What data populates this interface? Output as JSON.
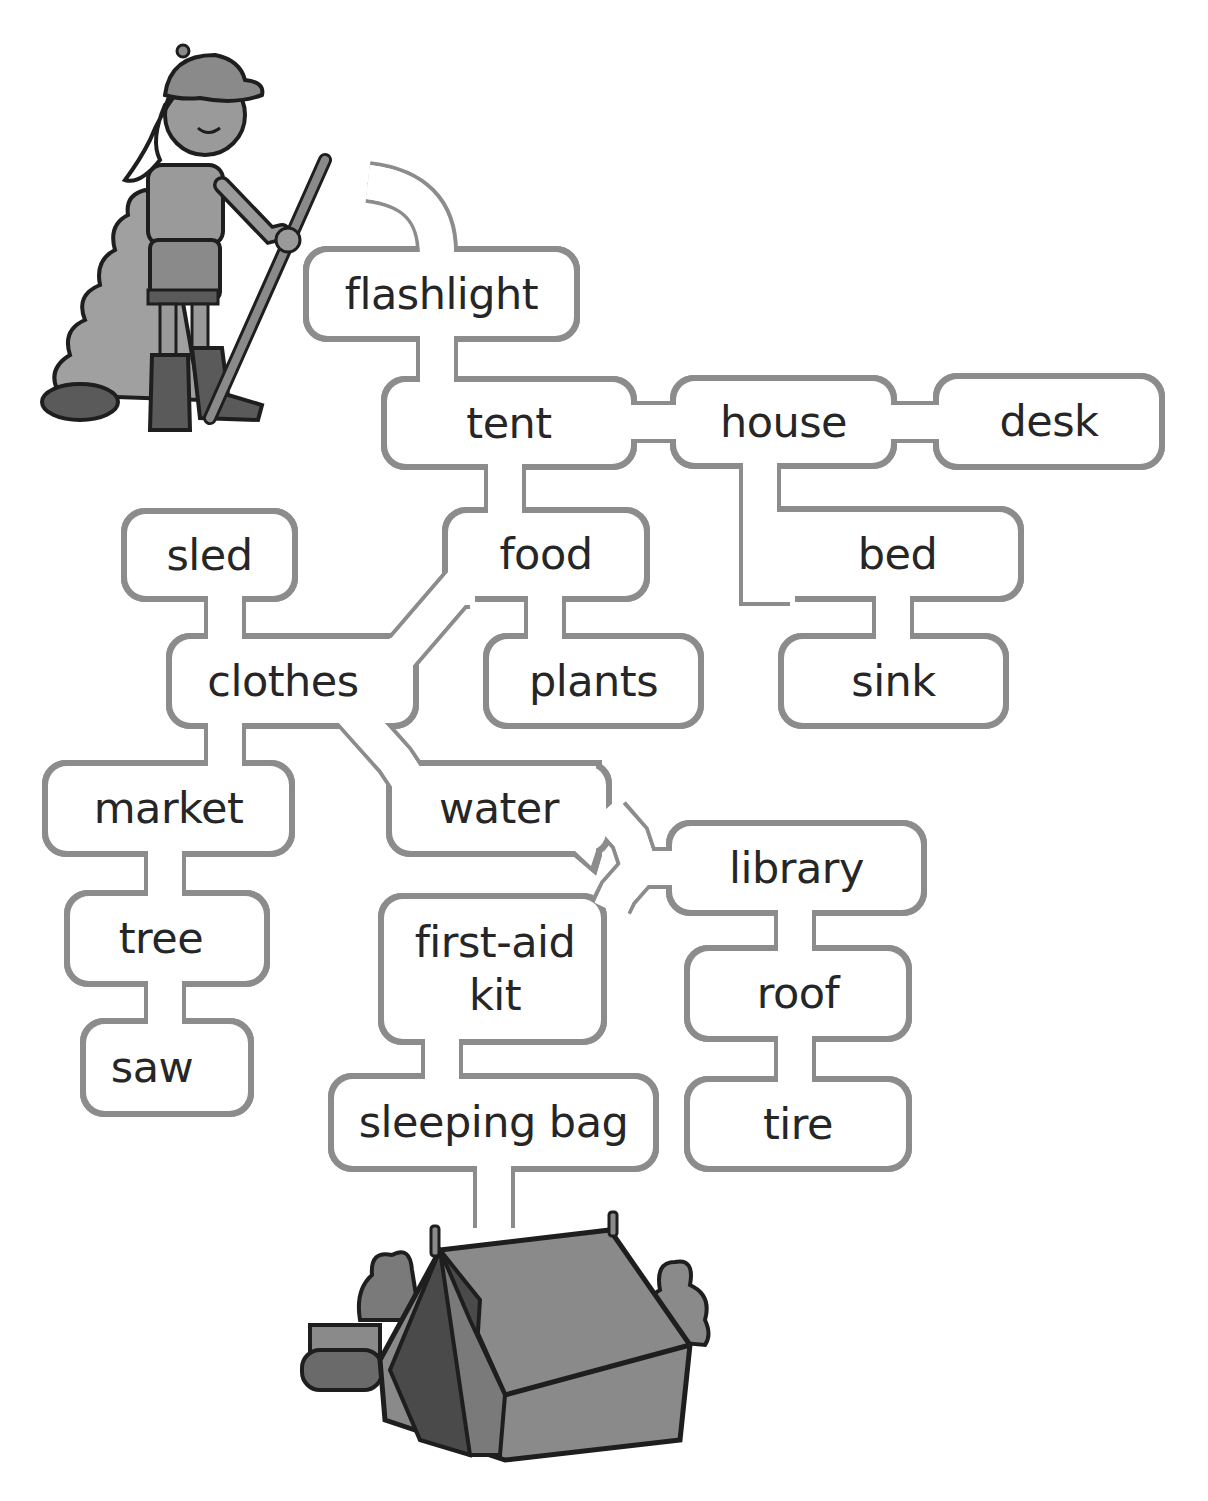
{
  "puzzle": {
    "type": "word-maze",
    "start_illustration": "scout-girl-with-walking-stick",
    "end_illustration": "camping-tent",
    "colors": {
      "path_line": "#8c8c8c",
      "text": "#262626",
      "illustration_fill": "#8a8a8a",
      "illustration_outline": "#1e1e1e"
    }
  },
  "words": {
    "flashlight": "flashlight",
    "tent": "tent",
    "house": "house",
    "desk": "desk",
    "food": "food",
    "bed": "bed",
    "sled": "sled",
    "clothes": "clothes",
    "plants": "plants",
    "sink": "sink",
    "market": "market",
    "water": "water",
    "library": "library",
    "tree": "tree",
    "first_aid_kit": "first-aid kit",
    "roof": "roof",
    "saw": "saw",
    "sleeping_bag": "sleeping bag",
    "tire": "tire"
  }
}
